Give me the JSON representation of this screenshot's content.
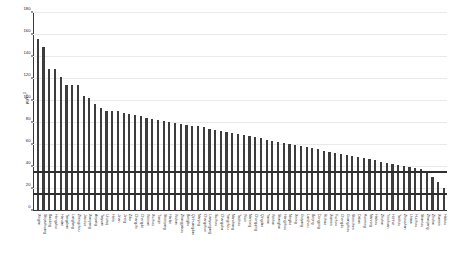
{
  "chart_data": {
    "type": "bar",
    "title": "",
    "xlabel": "",
    "ylabel": "μg/m",
    "ylabel_exponent": "3",
    "ylim": [
      0,
      180
    ],
    "yticks": [
      0,
      20,
      40,
      60,
      80,
      100,
      120,
      140,
      160,
      180
    ],
    "ytick_labels": [
      "0",
      "20",
      "40",
      "60",
      "80",
      "100",
      "120",
      "140",
      "160",
      "180"
    ],
    "grid": true,
    "legend": "none",
    "bar_color": "#3d3d3d",
    "reference_lines": [
      {
        "value": 35,
        "label": "",
        "color": "#2e2e2e"
      },
      {
        "value": 15,
        "label": "",
        "color": "#2e2e2e"
      }
    ],
    "categories": [
      "Xingtai",
      "Shijiazhuang",
      "Baoding",
      "Hengshui",
      "Handan",
      "Tangshan",
      "Langfang",
      "Zhengzhou",
      "Jiaozuo",
      "Xianyang",
      "Anyang",
      "Taiyuan",
      "Urumqi",
      "Hefei",
      "Jinan",
      "Jining",
      "Zibo",
      "Changzhi",
      "Chengde",
      "Weinan",
      "Xuzhou",
      "Tianjin",
      "Shenyang",
      "Harbin",
      "Wuhan",
      "Zhangjiakou",
      "Bengbu",
      "Qinhuangdao",
      "Nanjing",
      "Changchun",
      "Lianyungang",
      "Suzhou",
      "Changsha",
      "Yangzhou",
      "Nanchang",
      "Taizhou",
      "Wuxi",
      "Nantong",
      "Chongqing",
      "Qingdao",
      "Yantai",
      "Weihai",
      "Shanghai",
      "Hangzhou",
      "Ningbo",
      "Xining",
      "Guiyang",
      "Lanzhou",
      "Beijing",
      "Dongying",
      "Rizhao",
      "Xiamen",
      "Fuzhou",
      "Chengdu",
      "Guangzhou",
      "Shenzhen",
      "Dalian",
      "Kunming",
      "Nanning",
      "Haikou",
      "Zhuhai",
      "Yinchuan",
      "Hohhot",
      "Taizhou",
      "Zhoushan",
      "Lhasa",
      "Huizhou",
      "Shantou",
      "Zhanjiang",
      "Zhuhai",
      "Xiamen",
      "Haikou"
    ],
    "values": [
      156,
      149,
      129,
      129,
      122,
      115,
      115,
      115,
      105,
      103,
      97,
      94,
      91,
      91,
      91,
      89,
      88,
      87,
      86,
      85,
      84,
      83,
      82,
      81,
      80,
      79,
      78,
      77,
      77,
      76,
      75,
      74,
      73,
      72,
      71,
      70,
      69,
      68,
      67,
      66,
      65,
      64,
      63,
      62,
      61,
      60,
      59,
      58,
      57,
      56,
      55,
      54,
      53,
      52,
      51,
      50,
      49,
      48,
      47,
      46,
      45,
      44,
      43,
      42,
      41,
      40,
      39,
      38,
      36,
      31,
      26,
      21
    ]
  }
}
